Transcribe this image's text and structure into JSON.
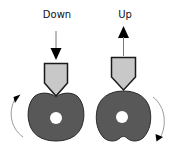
{
  "diagram": {
    "labels": {
      "down": "Down",
      "up": "Up"
    },
    "colors": {
      "cam_fill": "#585858",
      "cam_stroke": "#2a2a2a",
      "follower_fill": "#c8c8c8",
      "follower_stroke": "#1a1a1a",
      "arrow": "#000000",
      "rotation_arc": "#9a9a9a",
      "hole": "#ffffff"
    },
    "panels": [
      {
        "id": "left",
        "label_key": "down",
        "follower_direction": "down",
        "rotation": "counterclockwise"
      },
      {
        "id": "right",
        "label_key": "up",
        "follower_direction": "up",
        "rotation": "clockwise"
      }
    ]
  }
}
